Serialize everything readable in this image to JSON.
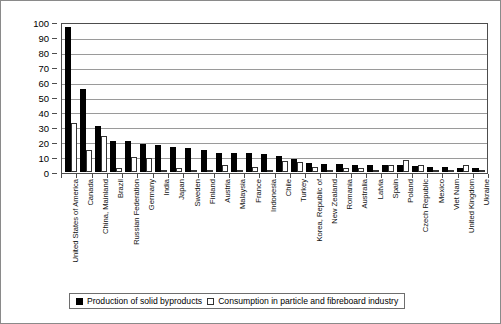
{
  "chart_data": {
    "type": "bar",
    "title": "",
    "xlabel": "",
    "ylabel": "[million scm]",
    "ylim": [
      0,
      100
    ],
    "yticks": [
      0,
      10,
      20,
      30,
      40,
      50,
      60,
      70,
      80,
      90,
      100
    ],
    "grid": true,
    "legend_position": "bottom",
    "categories": [
      "United States of America",
      "Canada",
      "China, Mainland",
      "Brazil",
      "Russian Federation",
      "Germany",
      "India",
      "Japan",
      "Sweden",
      "Finland",
      "Austria",
      "Malaysia",
      "France",
      "Indonesia",
      "Chile",
      "Turkey",
      "Korea, Republic of",
      "New Zealand",
      "Romania",
      "Australia",
      "Latvia",
      "Spain",
      "Poland",
      "Czech Republic",
      "Mexico",
      "Viet Nam",
      "United Kingdom",
      "Ukraine"
    ],
    "series": [
      {
        "name": "Production of solid byproducts",
        "color": "#000000",
        "values": [
          97,
          56,
          31,
          21,
          21,
          19,
          18,
          17,
          16,
          14.5,
          13,
          13,
          12.5,
          12,
          11,
          9,
          6,
          5.5,
          5.5,
          5,
          4.5,
          4.5,
          4.5,
          4,
          3.5,
          3.5,
          3,
          2.5
        ]
      },
      {
        "name": "Consumption in particle and fibreboard industry",
        "color": "#ffffff",
        "values": [
          33,
          14.5,
          24,
          3,
          10,
          9.5,
          1.5,
          3,
          1.5,
          1,
          5,
          1,
          3.5,
          1,
          7.5,
          6.5,
          3.5,
          0.5,
          3,
          2.5,
          1.5,
          5,
          8,
          4.5,
          1,
          1.5,
          5,
          1.5
        ]
      }
    ]
  },
  "legend": {
    "items": [
      {
        "label": "Production of solid byproducts",
        "marker": "filled-square-icon"
      },
      {
        "label": "Consumption in particle and fibreboard industry",
        "marker": "empty-square-icon"
      }
    ]
  }
}
